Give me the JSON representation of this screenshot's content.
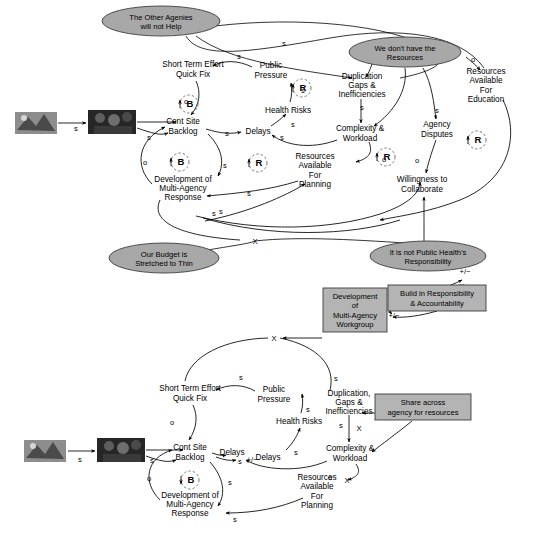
{
  "diagram": {
    "type": "causal-loop-diagram",
    "title_visible": false,
    "panels": [
      {
        "id": "upper",
        "name": "current-system-structure",
        "variables": [
          {
            "id": "u-short-term",
            "lines": [
              "Short Term Effort",
              "Quick Fix"
            ],
            "x": 193,
            "y": 69
          },
          {
            "id": "u-public-pressure",
            "lines": [
              "Public",
              "Pressure"
            ],
            "x": 271,
            "y": 70
          },
          {
            "id": "u-health-risks",
            "lines": [
              "Health Risks"
            ],
            "x": 288,
            "y": 110
          },
          {
            "id": "u-duplication",
            "lines": [
              "Duplication",
              "Gaps &",
              "Inefficiencies"
            ],
            "x": 362,
            "y": 85
          },
          {
            "id": "u-complexity",
            "lines": [
              "Complexity &",
              "Workload"
            ],
            "x": 360,
            "y": 133
          },
          {
            "id": "u-resources-education",
            "lines": [
              "Resources",
              "Available",
              "For",
              "Education"
            ],
            "x": 486,
            "y": 85
          },
          {
            "id": "u-agency-disputes",
            "lines": [
              "Agency",
              "Disputes"
            ],
            "x": 437,
            "y": 129
          },
          {
            "id": "u-cont-site-backlog",
            "lines": [
              "Cont Site",
              "Backlog"
            ],
            "x": 183,
            "y": 126
          },
          {
            "id": "u-delays",
            "lines": [
              "Delays"
            ],
            "x": 258,
            "y": 131
          },
          {
            "id": "u-resources-planning",
            "lines": [
              "Resources",
              "Available",
              "For",
              "Planning"
            ],
            "x": 315,
            "y": 170
          },
          {
            "id": "u-willingness",
            "lines": [
              "Willingness to",
              "Collaborate"
            ],
            "x": 422,
            "y": 184
          },
          {
            "id": "u-development",
            "lines": [
              "Development of",
              "Multi-Agency",
              "Response"
            ],
            "x": 183,
            "y": 188
          }
        ],
        "loops": [
          {
            "id": "u-loop-b1",
            "label": "B",
            "x": 189,
            "y": 104
          },
          {
            "id": "u-loop-r1",
            "label": "R",
            "x": 302,
            "y": 88
          },
          {
            "id": "u-loop-b2",
            "label": "B",
            "x": 180,
            "y": 162
          },
          {
            "id": "u-loop-r2",
            "label": "R",
            "x": 258,
            "y": 163
          },
          {
            "id": "u-loop-r3",
            "label": "R",
            "x": 386,
            "y": 157
          },
          {
            "id": "u-loop-r4",
            "label": "R",
            "x": 477,
            "y": 140
          }
        ],
        "mental_models": [
          {
            "id": "u-mm-other-agencies",
            "lines": [
              "The Other Agenies",
              "will not Help"
            ],
            "cx": 161,
            "cy": 21,
            "rx": 59,
            "ry": 15
          },
          {
            "id": "u-mm-no-resources",
            "lines": [
              "We don't have the",
              "Resources"
            ],
            "cx": 405,
            "cy": 52,
            "rx": 56,
            "ry": 15
          },
          {
            "id": "u-mm-budget",
            "lines": [
              "Our Budget is",
              "Stretched to Thin"
            ],
            "cx": 164,
            "cy": 258,
            "rx": 55,
            "ry": 15
          },
          {
            "id": "u-mm-public-health",
            "lines": [
              "It is not Public Health's",
              "Responsibility"
            ],
            "cx": 428,
            "cy": 256,
            "rx": 58,
            "ry": 15
          }
        ],
        "polarity_labels": [
          {
            "text": "s",
            "x": 76,
            "y": 131
          },
          {
            "text": "s",
            "x": 149,
            "y": 140
          },
          {
            "text": "s",
            "x": 239,
            "y": 59
          },
          {
            "text": "s",
            "x": 284,
            "y": 46
          },
          {
            "text": "s",
            "x": 303,
            "y": 93
          },
          {
            "text": "s",
            "x": 362,
            "y": 110
          },
          {
            "text": "s",
            "x": 437,
            "y": 113
          },
          {
            "text": "s",
            "x": 227,
            "y": 136
          },
          {
            "text": "s",
            "x": 282,
            "y": 140
          },
          {
            "text": "s",
            "x": 293,
            "y": 127
          },
          {
            "text": "s",
            "x": 225,
            "y": 168
          },
          {
            "text": "s",
            "x": 249,
            "y": 196
          },
          {
            "text": "s",
            "x": 221,
            "y": 214
          },
          {
            "text": "s",
            "x": 214,
            "y": 216
          },
          {
            "text": "o",
            "x": 186,
            "y": 104
          },
          {
            "text": "o",
            "x": 384,
            "y": 162
          },
          {
            "text": "o",
            "x": 145,
            "y": 165
          },
          {
            "text": "o",
            "x": 473,
            "y": 62
          },
          {
            "text": "o",
            "x": 417,
            "y": 163
          }
        ]
      },
      {
        "id": "lower",
        "name": "intervention-leverage-points",
        "variables": [
          {
            "id": "l-short-term",
            "lines": [
              "Short Term Effort",
              "Quick Fix"
            ],
            "x": 190,
            "y": 393
          },
          {
            "id": "l-public-pressure",
            "lines": [
              "Public",
              "Pressure"
            ],
            "x": 274,
            "y": 394
          },
          {
            "id": "l-health-risks",
            "lines": [
              "Health Risks"
            ],
            "x": 299,
            "y": 421
          },
          {
            "id": "l-duplication",
            "lines": [
              "Duplication,",
              "Gaps &",
              "Inefficiencies"
            ],
            "x": 349,
            "y": 402
          },
          {
            "id": "l-complexity",
            "lines": [
              "Complexity &",
              "Workload"
            ],
            "x": 350,
            "y": 453
          },
          {
            "id": "l-cont-site-backlog",
            "lines": [
              "Cont Site",
              "Backlog"
            ],
            "x": 190,
            "y": 452
          },
          {
            "id": "l-delays-1",
            "lines": [
              "Delays"
            ],
            "x": 232,
            "y": 452
          },
          {
            "id": "l-delays-2",
            "lines": [
              "Delays"
            ],
            "x": 268,
            "y": 457
          },
          {
            "id": "l-resources-planning",
            "lines": [
              "Resources",
              "Available",
              "For",
              "Planning"
            ],
            "x": 317,
            "y": 491
          },
          {
            "id": "l-development",
            "lines": [
              "Development of",
              "Multi-Agency",
              "Response"
            ],
            "x": 190,
            "y": 504
          }
        ],
        "loops": [
          {
            "id": "l-loop-b1",
            "label": "B",
            "x": 190,
            "y": 480
          }
        ],
        "mental_models": [],
        "interventions": [
          {
            "id": "l-box-workgroup",
            "lines": [
              "Development",
              "of",
              "Multi-Agency",
              "Workgroup"
            ],
            "x": 355,
            "y": 310,
            "w": 64,
            "h": 44
          },
          {
            "id": "l-box-responsibility",
            "lines": [
              "Build in Responsibility",
              "& Accountability"
            ],
            "x": 437,
            "y": 298,
            "w": 98,
            "h": 26
          },
          {
            "id": "l-box-share",
            "lines": [
              "Share across",
              "agency for resources"
            ],
            "x": 423,
            "y": 407,
            "w": 96,
            "h": 26
          }
        ],
        "polarity_labels": [
          {
            "text": "s",
            "x": 80,
            "y": 462
          },
          {
            "text": "s",
            "x": 152,
            "y": 463
          },
          {
            "text": "s",
            "x": 241,
            "y": 380
          },
          {
            "text": "s",
            "x": 336,
            "y": 381
          },
          {
            "text": "s",
            "x": 308,
            "y": 412
          },
          {
            "text": "s",
            "x": 296,
            "y": 455
          },
          {
            "text": "s",
            "x": 341,
            "y": 428
          },
          {
            "text": "s",
            "x": 240,
            "y": 464
          },
          {
            "text": "s",
            "x": 230,
            "y": 485
          },
          {
            "text": "s",
            "x": 235,
            "y": 522
          },
          {
            "text": "o",
            "x": 172,
            "y": 425
          },
          {
            "text": "o",
            "x": 149,
            "y": 481
          },
          {
            "text": "o",
            "x": 330,
            "y": 480
          }
        ],
        "x_markers": [
          {
            "x": 274,
            "y": 338
          },
          {
            "x": 359,
            "y": 428
          },
          {
            "x": 347,
            "y": 480
          }
        ],
        "plusminus_labels": [
          {
            "text": "+/−",
            "x": 252,
            "y": 462
          },
          {
            "text": "+/−",
            "x": 394,
            "y": 318
          },
          {
            "text": "+/−",
            "x": 465,
            "y": 274
          }
        ]
      }
    ],
    "cross_panel_x_markers": [
      {
        "x": 255,
        "y": 241
      },
      {
        "x": 462,
        "y": 286
      }
    ],
    "photos": [
      {
        "id": "u-photo-left",
        "x": 15,
        "y": 112,
        "w": 42,
        "h": 22,
        "kind": "archival-photo"
      },
      {
        "id": "u-photo-right",
        "x": 88,
        "y": 110,
        "w": 48,
        "h": 24,
        "kind": "archival-photo"
      },
      {
        "id": "l-photo-left",
        "x": 24,
        "y": 440,
        "w": 42,
        "h": 22,
        "kind": "archival-photo"
      },
      {
        "id": "l-photo-right",
        "x": 97,
        "y": 438,
        "w": 48,
        "h": 24,
        "kind": "archival-photo"
      }
    ],
    "legend": {
      "balancing_symbol": "B",
      "reinforcing_symbol": "R",
      "same_direction": "s",
      "opposite_direction": "o",
      "blocked_link": "X",
      "ambiguous_polarity": "+/−"
    },
    "colors": {
      "mental_model_fill": "#a8a8a8",
      "intervention_fill": "#b4b4b4",
      "stroke": "#3c3c3c",
      "link": "#000000",
      "background": "#ffffff"
    }
  }
}
